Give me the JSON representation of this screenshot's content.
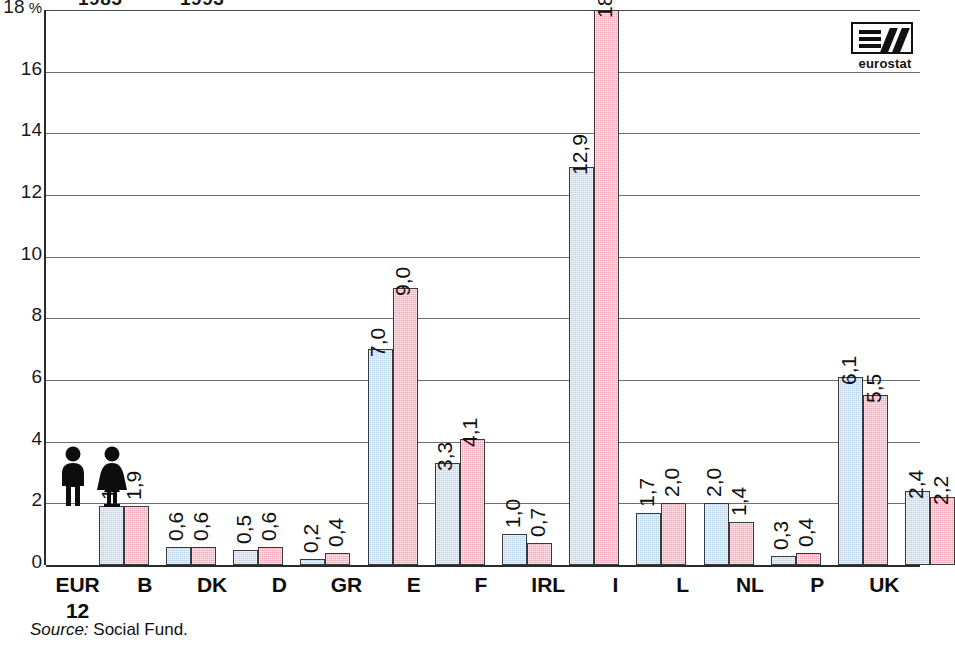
{
  "legend": {
    "items": [
      {
        "label": "1985",
        "key": "male",
        "color": "#bcd2e8",
        "truncated": true
      },
      {
        "label": "1993",
        "key": "female",
        "color": "#f1a8b5",
        "truncated": true
      }
    ]
  },
  "logo": {
    "name": "eurostat"
  },
  "source": {
    "label": "Source:",
    "text": "Social Fund."
  },
  "pictograms": [
    {
      "name": "male-figure-icon"
    },
    {
      "name": "female-figure-icon"
    }
  ],
  "chart_data": {
    "type": "bar",
    "title": "",
    "subtitle": "",
    "xlabel": "",
    "ylabel": "%",
    "ylim": [
      0,
      18
    ],
    "yticks": [
      0,
      2,
      4,
      6,
      8,
      10,
      12,
      14,
      16,
      18
    ],
    "ytick_labels": [
      "0",
      "2",
      "4",
      "6",
      "8",
      "10",
      "12",
      "14",
      "16",
      "18"
    ],
    "y_unit": "%",
    "grid": true,
    "legend_position": "top-left",
    "decimal_separator": ",",
    "categories": [
      "EUR 12",
      "B",
      "DK",
      "D",
      "GR",
      "E",
      "F",
      "IRL",
      "I",
      "L",
      "NL",
      "P",
      "UK"
    ],
    "category_lines": [
      [
        "EUR",
        "12"
      ],
      [
        "B"
      ],
      [
        "DK"
      ],
      [
        "D"
      ],
      [
        "GR"
      ],
      [
        "E"
      ],
      [
        "F"
      ],
      [
        "IRL"
      ],
      [
        "I"
      ],
      [
        "L"
      ],
      [
        "NL"
      ],
      [
        "P"
      ],
      [
        "UK"
      ]
    ],
    "series": [
      {
        "name": "1985",
        "color": "#bcd2e8",
        "values": [
          1.9,
          0.6,
          0.5,
          0.2,
          7.0,
          3.3,
          1.0,
          12.9,
          1.7,
          2.0,
          0.3,
          6.1,
          2.4
        ],
        "labels": [
          "1,9",
          "0,6",
          "0,5",
          "0,2",
          "7,0",
          "3,3",
          "1,0",
          "12,9",
          "1,7",
          "2,0",
          "0,3",
          "6,1",
          "2,4"
        ]
      },
      {
        "name": "1993",
        "color": "#f1a8b5",
        "values": [
          1.9,
          0.6,
          0.6,
          0.4,
          9.0,
          4.1,
          0.7,
          18.0,
          2.0,
          1.4,
          0.4,
          5.5,
          2.2
        ],
        "labels": [
          "1,9",
          "0,6",
          "0,6",
          "0,4",
          "9,0",
          "4,1",
          "0,7",
          "18,0",
          "2,0",
          "1,4",
          "0,4",
          "5,5",
          "2,2"
        ]
      }
    ]
  }
}
